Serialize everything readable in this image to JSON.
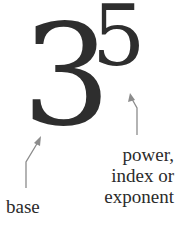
{
  "figure": {
    "base_value": "3",
    "exponent_value": "5",
    "labels": {
      "base": "base",
      "exponent_line1": "power,",
      "exponent_line2": "index or",
      "exponent_line3": "exponent"
    },
    "colors": {
      "digits": "#2e2e2e",
      "arrows": "#8c8c8c",
      "text": "#2b2b2b"
    }
  }
}
